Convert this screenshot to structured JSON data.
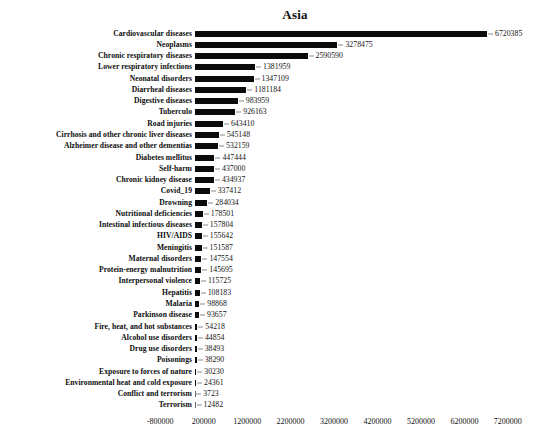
{
  "chart_data": {
    "type": "bar",
    "orientation": "horizontal",
    "title": "Asia",
    "xlabel": "",
    "ylabel": "",
    "grid": false,
    "legend": "none",
    "xlim": [
      -800000,
      7200000
    ],
    "xticks": [
      -800000,
      200000,
      1200000,
      2200000,
      3200000,
      4200000,
      5200000,
      6200000,
      7200000
    ],
    "xtick_labels": [
      "-800000",
      "200000",
      "1200000",
      "2200000",
      "3200000",
      "4200000",
      "5200000",
      "6200000",
      "7200000"
    ],
    "bar_color": "#0b0b0b",
    "categories": [
      "Cardiovascular diseases",
      "Neoplasms",
      "Chronic respiratory diseases",
      "Lower respiratory infections",
      "Neonatal disorders",
      "Diarrheal diseases",
      "Digestive diseases",
      "Tuberculo",
      "Road injuries",
      "Cirrhosis and other chronic liver diseases",
      "Alzheimer disease and other dementias",
      "Diabetes mellitus",
      "Self-harm",
      "Chronic kidney disease",
      "Covid_19",
      "Drowning",
      "Nutritional deficiencies",
      "Intestinal infectious diseases",
      "HIV/AIDS",
      "Meningitis",
      "Maternal disorders",
      "Protein-energy malnutrition",
      "Interpersonal violence",
      "Hepatitis",
      "Malaria",
      "Parkinson disease",
      "Fire, heat, and hot substances",
      "Alcohol use disorders",
      "Drug use disorders",
      "Poisonings",
      "Exposure to forces of nature",
      "Environmental heat and cold exposure",
      "Conflict and terrorism",
      "Terrorism"
    ],
    "values": [
      6720385,
      3278475,
      2590590,
      1381959,
      1347109,
      1181184,
      983959,
      926163,
      643410,
      545148,
      532159,
      447444,
      437000,
      434937,
      337412,
      284034,
      178501,
      157804,
      155642,
      151587,
      147554,
      145695,
      115725,
      108183,
      98868,
      93657,
      54218,
      44854,
      38493,
      38290,
      30230,
      24361,
      3723,
      12482
    ],
    "value_labels": [
      "6720385",
      "3278475",
      "2590590",
      "1381959",
      "1347109",
      "1181184",
      "983959",
      "926163",
      "643410",
      "545148",
      "532159",
      "447444",
      "437000",
      "434937",
      "337412",
      "284034",
      "178501",
      "157804",
      "155642",
      "151587",
      "147554",
      "145695",
      "115725",
      "108183",
      "98868",
      "93657",
      "54218",
      "44854",
      "38493",
      "38290",
      "30230",
      "24361",
      "3723",
      "12482"
    ]
  }
}
